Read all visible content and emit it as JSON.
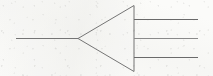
{
  "canvas": {
    "width": 213,
    "height": 76,
    "background_color": "#fbfbf9",
    "paper_tint_color": "#ecece9"
  },
  "figure": {
    "title": "Amplifier / buffer triangle symbol with one input and three output leads",
    "stroke_color": "#757575",
    "stroke_color_dark": "#6a6a6a",
    "stroke_width": 1
  },
  "chart_data": {
    "type": "diagram",
    "units": "pixels",
    "xlim": [
      0,
      213
    ],
    "ylim": [
      0,
      76
    ],
    "grid": false,
    "legend": "none",
    "elements": [
      {
        "name": "input-lead",
        "shape": "line",
        "x1": 16,
        "y1": 38,
        "x2": 78,
        "y2": 38,
        "color": "#757575",
        "width": 1
      },
      {
        "name": "triangle-body",
        "shape": "polygon",
        "points": [
          [
            78,
            38
          ],
          [
            134,
            5
          ],
          [
            134,
            71
          ]
        ],
        "fill": "none",
        "color": "#757575",
        "width": 1
      },
      {
        "name": "output-lead-top",
        "shape": "line",
        "x1": 134,
        "y1": 19,
        "x2": 198,
        "y2": 19,
        "color": "#6a6a6a",
        "width": 1
      },
      {
        "name": "output-lead-middle",
        "shape": "line",
        "x1": 134,
        "y1": 38,
        "x2": 198,
        "y2": 38,
        "color": "#8a8a8a",
        "width": 1
      },
      {
        "name": "output-lead-bottom",
        "shape": "line",
        "x1": 134,
        "y1": 57,
        "x2": 198,
        "y2": 57,
        "color": "#6a6a6a",
        "width": 1
      }
    ],
    "counts": {
      "input_leads": 1,
      "output_leads": 3,
      "triangle_vertices": 3
    },
    "annotations": [],
    "xlabel": "",
    "ylabel": ""
  }
}
